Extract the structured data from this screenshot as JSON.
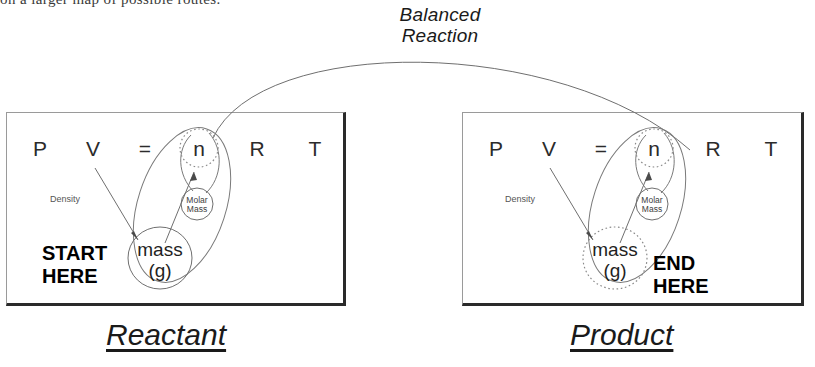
{
  "page": {
    "width": 815,
    "height": 367,
    "background": "#ffffff"
  },
  "header": {
    "clipped_text": "on a larger map of possible routes."
  },
  "arc_label": {
    "line1": "Balanced",
    "line2": "Reaction"
  },
  "boxes": [
    {
      "id": "reactant",
      "caption": "Reactant",
      "equation": [
        "P",
        "V",
        "=",
        "n",
        "R",
        "T"
      ],
      "n_label": "n",
      "mass_label_line1": "mass",
      "mass_label_line2": "(g)",
      "molar_line1": "Molar",
      "molar_line2": "Mass",
      "density_label": "Density",
      "here_line1": "START",
      "here_line2": "HERE",
      "n_circle_style": "dotted",
      "mass_circle_style": "solid"
    },
    {
      "id": "product",
      "caption": "Product",
      "equation": [
        "P",
        "V",
        "=",
        "n",
        "R",
        "T"
      ],
      "n_label": "n",
      "mass_label_line1": "mass",
      "mass_label_line2": "(g)",
      "molar_line1": "Molar",
      "molar_line2": "Mass",
      "density_label": "Density",
      "here_line1": "END",
      "here_line2": "HERE",
      "n_circle_style": "dotted",
      "mass_circle_style": "dotted"
    }
  ],
  "colors": {
    "ink": "#1a1a1a",
    "line": "#6f6f6f",
    "box_border": "#9a9a9a",
    "box_shadow": "#2a2a2a",
    "muted_text": "#555555"
  }
}
